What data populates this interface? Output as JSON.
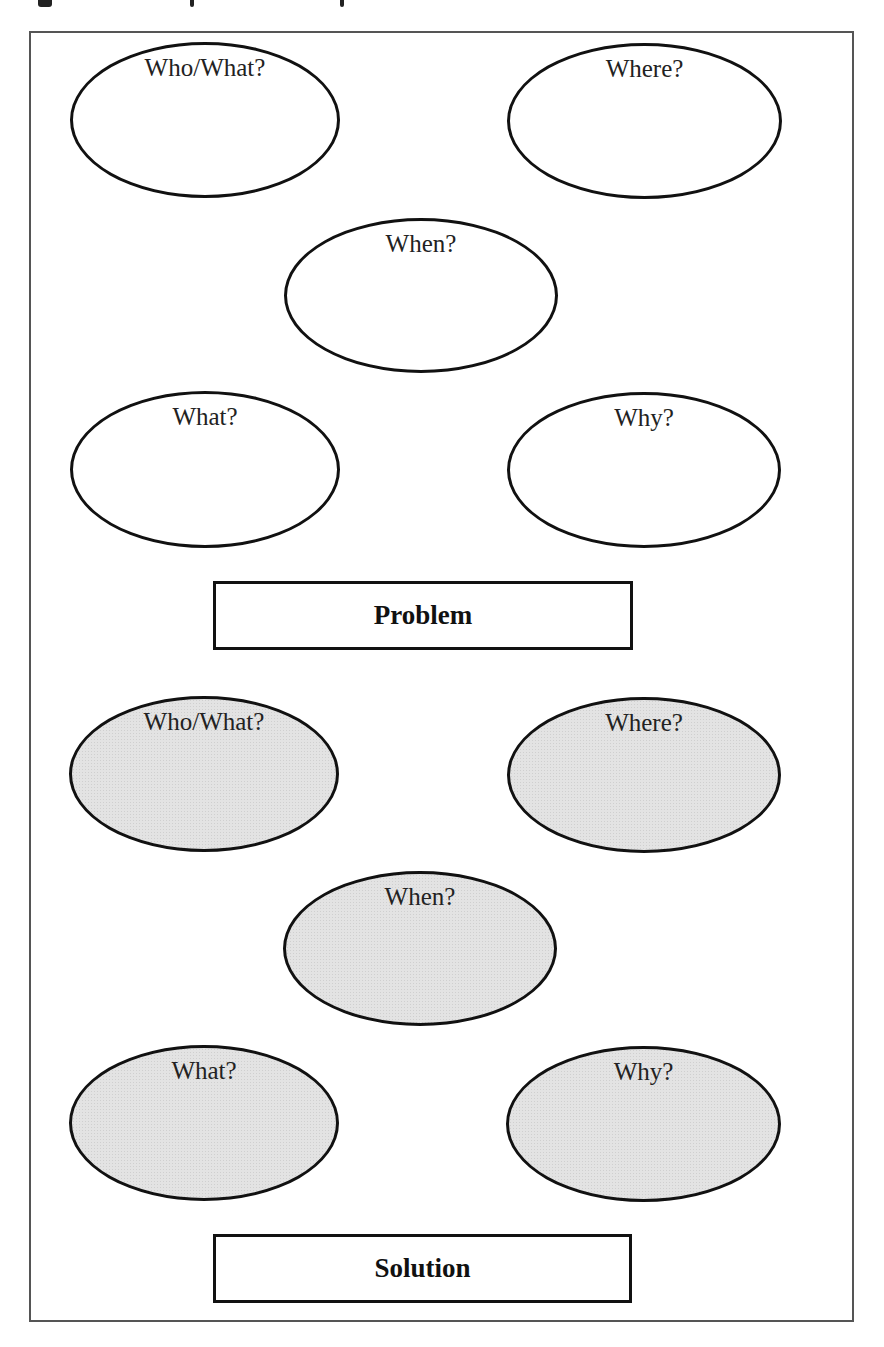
{
  "diagram": {
    "problem_section": {
      "ellipses": [
        {
          "label": "Who/What?",
          "left": 70,
          "top": 42,
          "width": 270,
          "height": 156
        },
        {
          "label": "Where?",
          "left": 507,
          "top": 43,
          "width": 275,
          "height": 156
        },
        {
          "label": "When?",
          "left": 284,
          "top": 218,
          "width": 274,
          "height": 155
        },
        {
          "label": "What?",
          "left": 70,
          "top": 391,
          "width": 270,
          "height": 157
        },
        {
          "label": "Why?",
          "left": 507,
          "top": 392,
          "width": 274,
          "height": 156
        }
      ],
      "box": {
        "label": "Problem",
        "left": 213,
        "top": 581,
        "width": 420,
        "height": 69
      }
    },
    "solution_section": {
      "ellipses": [
        {
          "label": "Who/What?",
          "left": 69,
          "top": 696,
          "width": 270,
          "height": 156
        },
        {
          "label": "Where?",
          "left": 507,
          "top": 697,
          "width": 274,
          "height": 156
        },
        {
          "label": "When?",
          "left": 283,
          "top": 871,
          "width": 274,
          "height": 155
        },
        {
          "label": "What?",
          "left": 69,
          "top": 1045,
          "width": 270,
          "height": 156
        },
        {
          "label": "Why?",
          "left": 506,
          "top": 1046,
          "width": 275,
          "height": 156
        }
      ],
      "box": {
        "label": "Solution",
        "left": 213,
        "top": 1234,
        "width": 419,
        "height": 69
      }
    },
    "colors": {
      "stroke": "#111111",
      "frame": "#555555",
      "shaded_fill": "#e3e3e3",
      "background": "#ffffff"
    }
  }
}
